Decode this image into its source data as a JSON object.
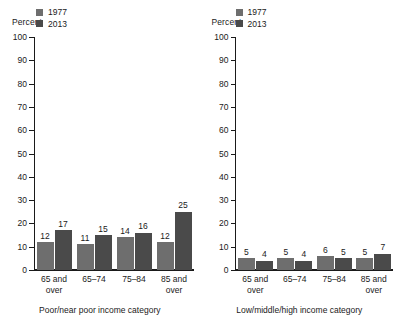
{
  "chart_data": {
    "type": "bar",
    "title": "",
    "ylabel": "Percent",
    "ylim": [
      0,
      100
    ],
    "yticks": [
      100,
      90,
      80,
      70,
      60,
      50,
      40,
      30,
      20,
      10,
      0
    ],
    "grid": false,
    "legend_position": "top-left",
    "legend": [
      "1977",
      "2013"
    ],
    "colors": {
      "1977": "#6e6e6e",
      "2013": "#4a4a4a",
      "axis": "#1a1a1a",
      "background": "#ffffff"
    },
    "panels": [
      {
        "xlabel": "Poor/near poor income category",
        "categories": [
          "65 and over",
          "65–74",
          "75–84",
          "85 and over"
        ],
        "category_lines": [
          [
            "65 and",
            "over"
          ],
          [
            "65–74",
            ""
          ],
          [
            "75–84",
            ""
          ],
          [
            "85 and",
            "over"
          ]
        ],
        "series": [
          {
            "name": "1977",
            "values": [
              12,
              11,
              14,
              12
            ]
          },
          {
            "name": "2013",
            "values": [
              17,
              15,
              16,
              25
            ]
          }
        ]
      },
      {
        "xlabel": "Low/middle/high income category",
        "categories": [
          "65 and over",
          "65–74",
          "75–84",
          "85 and over"
        ],
        "category_lines": [
          [
            "65 and",
            "over"
          ],
          [
            "65–74",
            ""
          ],
          [
            "75–84",
            ""
          ],
          [
            "85 and",
            "over"
          ]
        ],
        "series": [
          {
            "name": "1977",
            "values": [
              5,
              5,
              6,
              5
            ]
          },
          {
            "name": "2013",
            "values": [
              4,
              4,
              5,
              7
            ]
          }
        ]
      }
    ]
  }
}
